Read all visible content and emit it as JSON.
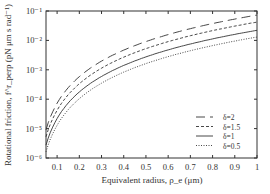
{
  "chart_data": {
    "type": "line",
    "title": "",
    "xlabel": "Equivalent radius, ρ_e (μm)",
    "ylabel": "Rotational friction, f^r_perp (pN μm s rad⁻¹)",
    "xlim": [
      0.05,
      1.0
    ],
    "ylim": [
      1e-06,
      0.1
    ],
    "yscale": "log",
    "x_ticks": [
      "0.1",
      "0.2",
      "0.3",
      "0.4",
      "0.5",
      "0.6",
      "0.7",
      "0.8",
      "0.9",
      "1"
    ],
    "x_tick_values": [
      0.1,
      0.2,
      0.3,
      0.4,
      0.5,
      0.6,
      0.7,
      0.8,
      0.9,
      1.0
    ],
    "y_ticks": [
      "10⁻⁶",
      "10⁻⁵",
      "10⁻⁴",
      "10⁻³",
      "10⁻²",
      "10⁻¹"
    ],
    "y_tick_values": [
      1e-06,
      1e-05,
      0.0001,
      0.001,
      0.01,
      0.1
    ],
    "grid": false,
    "legend_position": "bottom-right",
    "x": [
      0.05,
      0.1,
      0.15,
      0.2,
      0.25,
      0.3,
      0.35,
      0.4,
      0.45,
      0.5,
      0.55,
      0.6,
      0.65,
      0.7,
      0.75,
      0.8,
      0.85,
      0.9,
      0.95,
      1.0
    ],
    "series": [
      {
        "name": "δ=2",
        "style": "longdash",
        "coef": 0.073
      },
      {
        "name": "δ=1.5",
        "style": "dash",
        "coef": 0.042
      },
      {
        "name": "δ=1",
        "style": "solid",
        "coef": 0.022
      },
      {
        "name": "δ=0.5",
        "style": "dot",
        "coef": 0.013
      }
    ],
    "model": "f = coef * x^3"
  }
}
